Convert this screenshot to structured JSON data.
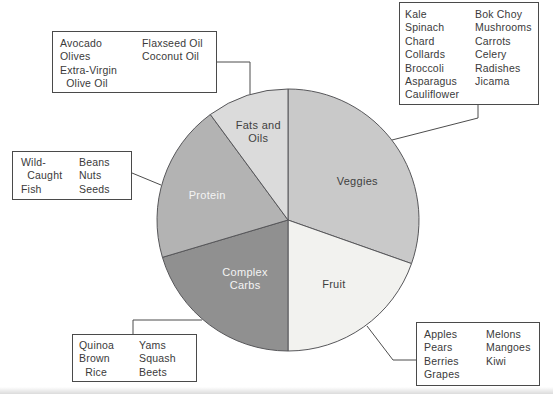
{
  "chart_data": {
    "type": "pie",
    "title": "",
    "direction": "clockwise",
    "start_angle_deg": 0,
    "legend": false,
    "grid": false,
    "segments": [
      {
        "label": "Veggies",
        "label_lines": [
          "Veggies"
        ],
        "value_pct": 30.4,
        "color": "#c9c9c9",
        "label_color": "#3f3f3f"
      },
      {
        "label": "Fruit",
        "label_lines": [
          "Fruit"
        ],
        "value_pct": 19.6,
        "color": "#f2f2ef",
        "label_color": "#3f3f3f"
      },
      {
        "label": "Complex Carbs",
        "label_lines": [
          "Complex",
          "Carbs"
        ],
        "value_pct": 20.4,
        "color": "#909090",
        "label_color": "#f4f4f4"
      },
      {
        "label": "Protein",
        "label_lines": [
          "Protein"
        ],
        "value_pct": 19.5,
        "color": "#b3b3b3",
        "label_color": "#f4f4f4"
      },
      {
        "label": "Fats and Oils",
        "label_lines": [
          "Fats and",
          "Oils"
        ],
        "value_pct": 10.1,
        "color": "#dbdbdb",
        "label_color": "#3f3f3f"
      }
    ]
  },
  "callouts": [
    {
      "id": "fats-and-oils",
      "segment": "Fats and Oils",
      "col1": [
        "Avocado",
        "Olives",
        "Extra-Virgin",
        "  Olive Oil"
      ],
      "col2": [
        "Flaxseed Oil",
        "Coconut Oil"
      ]
    },
    {
      "id": "veggies",
      "segment": "Veggies",
      "col1": [
        "Kale",
        "Spinach",
        "Chard",
        "Collards",
        "Broccoli",
        "Asparagus",
        "Cauliflower"
      ],
      "col2": [
        "Bok Choy",
        "Mushrooms",
        "Carrots",
        "Celery",
        "Radishes",
        "Jicama"
      ]
    },
    {
      "id": "protein",
      "segment": "Protein",
      "col1": [
        "Wild-",
        "  Caught",
        "Fish"
      ],
      "col2": [
        "Beans",
        "Nuts",
        "Seeds"
      ]
    },
    {
      "id": "complex-carbs",
      "segment": "Complex Carbs",
      "col1": [
        "Quinoa",
        "Brown",
        "  Rice"
      ],
      "col2": [
        "Yams",
        "Squash",
        "Beets"
      ]
    },
    {
      "id": "fruit",
      "segment": "Fruit",
      "col1": [
        "Apples",
        "Pears",
        "Berries",
        "Grapes"
      ],
      "col2": [
        "Melons",
        "Mangoes",
        "Kiwi"
      ]
    }
  ],
  "colors": {
    "background": "#ffffff",
    "pie_stroke": "#57575a",
    "connector_line": "#4d4d4d",
    "box_border": "#4a4a4a",
    "box_background": "#ffffff",
    "box_text": "#3a3a3a"
  }
}
